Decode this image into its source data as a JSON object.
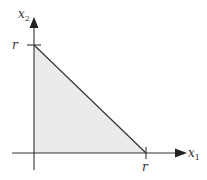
{
  "diagram": {
    "type": "feasible-region-triangle",
    "axes": {
      "x_label": "x",
      "x_sub": "1",
      "y_label": "x",
      "y_sub": "2"
    },
    "ticks": {
      "x_tick_label": "r",
      "y_tick_label": "r"
    },
    "colors": {
      "fill": "#ebebeb",
      "line": "#333333"
    }
  }
}
